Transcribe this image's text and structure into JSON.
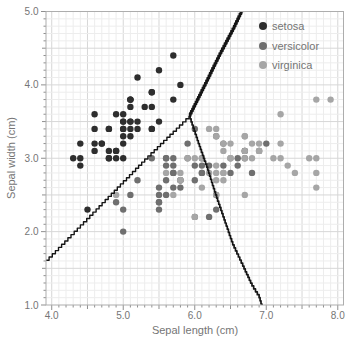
{
  "chart_data": {
    "type": "scatter",
    "xlabel": "Sepal length (cm)",
    "ylabel": "Sepal width (cm)",
    "xlim": [
      3.92,
      8.08
    ],
    "ylim": [
      1.0,
      5.0
    ],
    "x_tick_labels": [
      "4.0",
      "5.0",
      "6.0",
      "7.0",
      "8.0"
    ],
    "x_tick_values": [
      4,
      5,
      6,
      7,
      8
    ],
    "y_tick_labels": [
      "1.0",
      "2.0",
      "3.0",
      "4.0",
      "5.0"
    ],
    "y_tick_values": [
      1,
      2,
      3,
      4,
      5
    ],
    "grid": {
      "on": true,
      "minor_step": 0.1,
      "major_step": 0.5
    },
    "legend_position": "top-right",
    "marker_radius": 3.2,
    "series": [
      {
        "name": "setosa",
        "color": "#2e2e2e",
        "points": [
          [
            5.1,
            3.5
          ],
          [
            4.9,
            3.0
          ],
          [
            4.7,
            3.2
          ],
          [
            4.6,
            3.1
          ],
          [
            5.0,
            3.6
          ],
          [
            5.4,
            3.9
          ],
          [
            4.6,
            3.4
          ],
          [
            5.0,
            3.4
          ],
          [
            4.4,
            2.9
          ],
          [
            4.9,
            3.1
          ],
          [
            5.4,
            3.7
          ],
          [
            4.8,
            3.4
          ],
          [
            4.8,
            3.0
          ],
          [
            4.3,
            3.0
          ],
          [
            5.8,
            4.0
          ],
          [
            5.7,
            4.4
          ],
          [
            5.4,
            3.9
          ],
          [
            5.1,
            3.5
          ],
          [
            5.7,
            3.8
          ],
          [
            5.1,
            3.8
          ],
          [
            5.4,
            3.4
          ],
          [
            5.1,
            3.7
          ],
          [
            4.6,
            3.6
          ],
          [
            5.1,
            3.3
          ],
          [
            4.8,
            3.4
          ],
          [
            5.0,
            3.0
          ],
          [
            5.0,
            3.4
          ],
          [
            5.2,
            3.5
          ],
          [
            5.2,
            3.4
          ],
          [
            4.7,
            3.2
          ],
          [
            4.8,
            3.1
          ],
          [
            5.4,
            3.4
          ],
          [
            5.2,
            4.1
          ],
          [
            5.5,
            4.2
          ],
          [
            4.9,
            3.1
          ],
          [
            5.0,
            3.2
          ],
          [
            5.5,
            3.5
          ],
          [
            4.9,
            3.6
          ],
          [
            4.4,
            3.0
          ],
          [
            5.1,
            3.4
          ],
          [
            5.0,
            3.5
          ],
          [
            4.5,
            2.3
          ],
          [
            4.4,
            3.2
          ],
          [
            5.0,
            3.5
          ],
          [
            5.1,
            3.8
          ],
          [
            4.8,
            3.0
          ],
          [
            5.1,
            3.8
          ],
          [
            4.6,
            3.2
          ],
          [
            5.3,
            3.7
          ],
          [
            5.0,
            3.3
          ]
        ]
      },
      {
        "name": "versicolor",
        "color": "#6f6f6f",
        "points": [
          [
            7.0,
            3.2
          ],
          [
            6.4,
            3.2
          ],
          [
            6.9,
            3.1
          ],
          [
            5.5,
            2.3
          ],
          [
            6.5,
            2.8
          ],
          [
            5.7,
            2.8
          ],
          [
            6.3,
            3.3
          ],
          [
            4.9,
            2.4
          ],
          [
            6.6,
            2.9
          ],
          [
            5.2,
            2.7
          ],
          [
            5.0,
            2.0
          ],
          [
            5.9,
            3.0
          ],
          [
            6.0,
            2.2
          ],
          [
            6.1,
            2.9
          ],
          [
            5.6,
            2.9
          ],
          [
            6.7,
            3.1
          ],
          [
            5.6,
            3.0
          ],
          [
            5.8,
            2.7
          ],
          [
            6.2,
            2.2
          ],
          [
            5.6,
            2.5
          ],
          [
            5.9,
            3.2
          ],
          [
            6.1,
            2.8
          ],
          [
            6.3,
            2.5
          ],
          [
            6.1,
            2.8
          ],
          [
            6.4,
            2.9
          ],
          [
            6.6,
            3.0
          ],
          [
            6.8,
            2.8
          ],
          [
            6.7,
            3.0
          ],
          [
            6.0,
            2.9
          ],
          [
            5.7,
            2.6
          ],
          [
            5.5,
            2.4
          ],
          [
            5.5,
            2.4
          ],
          [
            5.8,
            2.7
          ],
          [
            6.0,
            2.7
          ],
          [
            5.4,
            3.0
          ],
          [
            6.0,
            3.4
          ],
          [
            6.7,
            3.1
          ],
          [
            6.3,
            2.3
          ],
          [
            5.6,
            3.0
          ],
          [
            5.5,
            2.5
          ],
          [
            5.5,
            2.6
          ],
          [
            6.1,
            3.0
          ],
          [
            5.8,
            2.6
          ],
          [
            5.0,
            2.3
          ],
          [
            5.6,
            2.7
          ],
          [
            5.7,
            3.0
          ],
          [
            5.7,
            2.9
          ],
          [
            6.2,
            2.9
          ],
          [
            5.1,
            2.5
          ],
          [
            5.7,
            2.8
          ]
        ]
      },
      {
        "name": "virginica",
        "color": "#a6a6a6",
        "points": [
          [
            6.3,
            3.3
          ],
          [
            5.8,
            2.7
          ],
          [
            7.1,
            3.0
          ],
          [
            6.3,
            2.9
          ],
          [
            6.5,
            3.0
          ],
          [
            7.6,
            3.0
          ],
          [
            4.9,
            2.5
          ],
          [
            7.3,
            2.9
          ],
          [
            6.7,
            2.5
          ],
          [
            7.2,
            3.6
          ],
          [
            6.5,
            3.2
          ],
          [
            6.4,
            2.7
          ],
          [
            6.8,
            3.0
          ],
          [
            5.7,
            2.5
          ],
          [
            5.8,
            2.8
          ],
          [
            6.4,
            3.2
          ],
          [
            6.5,
            3.0
          ],
          [
            7.7,
            3.8
          ],
          [
            7.7,
            2.6
          ],
          [
            6.0,
            2.2
          ],
          [
            6.9,
            3.2
          ],
          [
            5.6,
            2.8
          ],
          [
            7.7,
            2.8
          ],
          [
            6.3,
            2.7
          ],
          [
            6.7,
            3.3
          ],
          [
            7.2,
            3.2
          ],
          [
            6.2,
            2.8
          ],
          [
            6.1,
            3.0
          ],
          [
            6.4,
            2.8
          ],
          [
            7.2,
            3.0
          ],
          [
            7.4,
            2.8
          ],
          [
            7.9,
            3.8
          ],
          [
            6.4,
            2.8
          ],
          [
            6.3,
            2.8
          ],
          [
            6.1,
            2.6
          ],
          [
            7.7,
            3.0
          ],
          [
            6.3,
            3.4
          ],
          [
            6.4,
            3.1
          ],
          [
            6.0,
            3.0
          ],
          [
            6.9,
            3.1
          ],
          [
            6.7,
            3.1
          ],
          [
            6.9,
            3.1
          ],
          [
            5.8,
            2.7
          ],
          [
            6.8,
            3.2
          ],
          [
            6.7,
            3.3
          ],
          [
            6.7,
            3.0
          ],
          [
            6.3,
            2.5
          ],
          [
            6.5,
            3.0
          ],
          [
            6.2,
            3.4
          ],
          [
            5.9,
            3.0
          ]
        ]
      }
    ],
    "decision_boundaries": [
      {
        "name": "setosa-versicolor",
        "stroke_width": 1.4,
        "step": 3.2,
        "points": [
          [
            3.92,
            1.61
          ],
          [
            4.62,
            2.31
          ],
          [
            5.3,
            2.99
          ],
          [
            5.92,
            3.58
          ]
        ]
      },
      {
        "name": "setosa-virginica",
        "stroke_width": 2.8,
        "step": 2.4,
        "points": [
          [
            5.92,
            3.58
          ],
          [
            6.13,
            3.99
          ],
          [
            6.35,
            4.43
          ],
          [
            6.55,
            4.8
          ],
          [
            6.68,
            5.07
          ]
        ]
      },
      {
        "name": "versicolor-virginica",
        "stroke_width": 1.7,
        "step": 3.0,
        "points": [
          [
            5.92,
            3.58
          ],
          [
            6.05,
            3.2
          ],
          [
            6.18,
            2.84
          ],
          [
            6.29,
            2.5
          ],
          [
            6.41,
            2.16
          ],
          [
            6.53,
            1.82
          ],
          [
            6.67,
            1.53
          ],
          [
            6.8,
            1.26
          ],
          [
            6.9,
            1.1
          ],
          [
            6.94,
            0.97
          ]
        ]
      }
    ],
    "colors": {
      "spine": "#adadad",
      "tick": "#8f8f8f",
      "tick_label": "#757575",
      "grid_minor": "#ededed",
      "grid_major": "#d7d7d7",
      "boundary": "#151515",
      "background": "#ffffff",
      "legend_text": "#757575"
    }
  }
}
